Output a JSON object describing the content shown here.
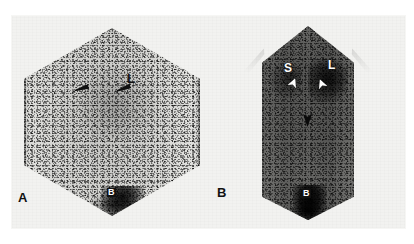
{
  "figure": {
    "type": "scintigraphy",
    "modality": "nuclear-medicine-scintigram",
    "top_text_fragment": "",
    "background_color": "#ffffff",
    "plate_color": "#f2f2f0"
  },
  "panels": [
    {
      "tag": "A",
      "tag_color": "#111111",
      "field_of_view": "hexagonal",
      "tone": "light",
      "annotations": [
        {
          "name": "liver-label",
          "text": "L",
          "style": "black"
        },
        {
          "name": "bladder-label",
          "text": "B",
          "style": "white-on-dark"
        },
        {
          "name": "arrow-left",
          "text": "",
          "style": "black-arrow"
        },
        {
          "name": "arrow-right",
          "text": "",
          "style": "black-arrow"
        }
      ]
    },
    {
      "tag": "B",
      "tag_color": "#111111",
      "field_of_view": "body-silhouette",
      "tone": "dark",
      "annotations": [
        {
          "name": "spleen-label",
          "text": "S",
          "style": "white"
        },
        {
          "name": "liver-label",
          "text": "L",
          "style": "white"
        },
        {
          "name": "bladder-label",
          "text": "B",
          "style": "white-on-dark"
        },
        {
          "name": "arrowhead-left",
          "text": "",
          "style": "white-arrowhead"
        },
        {
          "name": "arrowhead-right",
          "text": "",
          "style": "white-arrowhead"
        },
        {
          "name": "arrowhead-center",
          "text": "",
          "style": "black-arrowhead"
        }
      ]
    }
  ],
  "labels": {
    "panel_a_tag": "A",
    "panel_b_tag": "B",
    "a_liver": "L",
    "a_bladder": "B",
    "b_spleen": "S",
    "b_liver": "L",
    "b_bladder": "B"
  }
}
